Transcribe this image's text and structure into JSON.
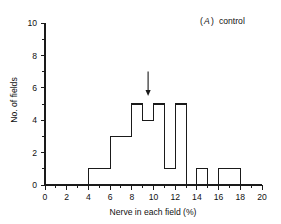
{
  "figure": {
    "panel_label_prefix": "(",
    "panel_letter": "A",
    "panel_label_suffix": ")",
    "panel_caption": "control",
    "ink_color": "#1a1a1a",
    "background_color": "#ffffff"
  },
  "chart_data": {
    "type": "bar",
    "xlabel": "Nerve in each field (%)",
    "ylabel": "No. of fields",
    "xlim": [
      0,
      20
    ],
    "ylim": [
      0,
      10
    ],
    "grid": false,
    "legend": null,
    "bin_width": 1,
    "x_tick_labels": [
      "0",
      "2",
      "4",
      "6",
      "8",
      "10",
      "12",
      "14",
      "16",
      "18",
      "20"
    ],
    "x_tick_values": [
      0,
      2,
      4,
      6,
      8,
      10,
      12,
      14,
      16,
      18,
      20
    ],
    "x_minor_tick_values": [
      1,
      3,
      5,
      7,
      9,
      11,
      13,
      15,
      17,
      19
    ],
    "y_tick_labels": [
      "0",
      "2",
      "4",
      "6",
      "8",
      "10"
    ],
    "y_tick_values": [
      0,
      2,
      4,
      6,
      8,
      10
    ],
    "y_minor_tick_values": [
      1,
      3,
      5,
      7,
      9
    ],
    "bins": [
      {
        "start": 0,
        "end": 1,
        "count": 0
      },
      {
        "start": 1,
        "end": 2,
        "count": 0
      },
      {
        "start": 2,
        "end": 3,
        "count": 0
      },
      {
        "start": 3,
        "end": 4,
        "count": 0
      },
      {
        "start": 4,
        "end": 5,
        "count": 1
      },
      {
        "start": 5,
        "end": 6,
        "count": 1
      },
      {
        "start": 6,
        "end": 7,
        "count": 3
      },
      {
        "start": 7,
        "end": 8,
        "count": 3
      },
      {
        "start": 8,
        "end": 9,
        "count": 5
      },
      {
        "start": 9,
        "end": 10,
        "count": 4
      },
      {
        "start": 10,
        "end": 11,
        "count": 5
      },
      {
        "start": 11,
        "end": 12,
        "count": 1
      },
      {
        "start": 12,
        "end": 13,
        "count": 5
      },
      {
        "start": 13,
        "end": 14,
        "count": 0
      },
      {
        "start": 14,
        "end": 15,
        "count": 1
      },
      {
        "start": 15,
        "end": 16,
        "count": 0
      },
      {
        "start": 16,
        "end": 17,
        "count": 1
      },
      {
        "start": 17,
        "end": 18,
        "count": 1
      },
      {
        "start": 18,
        "end": 19,
        "count": 0
      },
      {
        "start": 19,
        "end": 20,
        "count": 0
      }
    ],
    "annotations": [
      {
        "type": "arrow",
        "direction": "down",
        "x": 9.5,
        "y_top": 7.0,
        "y_tip": 5.5,
        "label": ""
      }
    ]
  }
}
